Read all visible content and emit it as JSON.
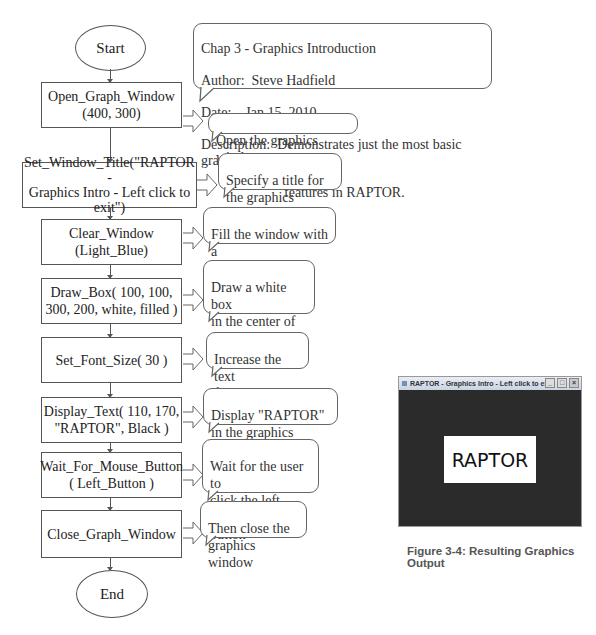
{
  "flowchart": {
    "start_label": "Start",
    "end_label": "End",
    "header_comment": {
      "line1": "Chap 3 - Graphics Introduction",
      "author_label": "Author:",
      "author": "Steve Hadfield",
      "date_label": "Date:",
      "date": "Jan 15, 2010",
      "description_label": "Description:",
      "description_line1": "Demonstrates just the most basic graphics",
      "description_line2": "features in RAPTOR."
    },
    "steps": [
      {
        "call": "Open_Graph_Window\n(400, 300)",
        "comment": "Open the graphics window"
      },
      {
        "call": "Set_Window_Title(\"RAPTOR -\nGraphics Intro  -  Left click to\nexit\")",
        "comment": "Specify a title for\nthe graphics window"
      },
      {
        "call": "Clear_Window\n(Light_Blue)",
        "comment": "Fill the window with a\nlight blue background"
      },
      {
        "call": "Draw_Box( 100, 100,\n300, 200, white, filled )",
        "comment": "Draw a white box\nin the center of the\ngraphics window"
      },
      {
        "call": "Set_Font_Size( 30 )",
        "comment": "Increase the text\nfont size to 30 pt"
      },
      {
        "call": "Display_Text( 110, 170,\n\"RAPTOR\", Black )",
        "comment": "Display \"RAPTOR\"\nin the graphics window"
      },
      {
        "call": "Wait_For_Mouse_Button\n( Left_Button )",
        "comment": "Wait for the user to\nclick the left mouse\nbutton"
      },
      {
        "call": "Close_Graph_Window",
        "comment": "Then close the\ngraphics window"
      }
    ]
  },
  "output_window": {
    "title": "RAPTOR - Graphics Intro - Left click to exit",
    "display_text": "RAPTOR",
    "minimize_icon": "_",
    "maximize_icon": "□",
    "close_icon": "×"
  },
  "figure_caption": "Figure 3-4:  Resulting Graphics Output"
}
